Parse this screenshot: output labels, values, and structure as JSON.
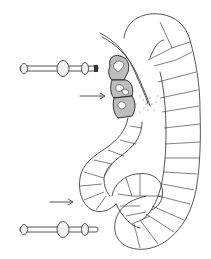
{
  "figure": {
    "type": "scientific-line-drawing",
    "background": "#ffffff",
    "ink_color": "#2a2a2a",
    "stipple_color": "#bdbdbd",
    "elements": {
      "segmented_tubule": {
        "description": "coiled segmented tubule with epithelial cell divisions"
      },
      "stippled_cell_cluster": {
        "description": "cluster of darkly stippled cells with pale nuclei",
        "cell_count": 3
      },
      "duct": {
        "description": "thin double-line duct entering near stippled cells"
      },
      "arrows": [
        {
          "id": "arrow-upper",
          "direction": "right"
        },
        {
          "id": "arrow-lower",
          "direction": "right"
        }
      ],
      "rods": [
        {
          "id": "rod-upper",
          "bead_count": 3
        },
        {
          "id": "rod-lower",
          "bead_count": 3
        }
      ]
    }
  }
}
